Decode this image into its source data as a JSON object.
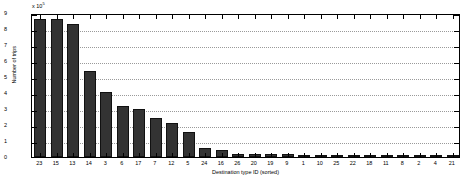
{
  "chart_data": {
    "type": "bar",
    "title": "",
    "xlabel": "Destination type ID (sorted)",
    "ylabel": "Number of trips",
    "y_multiplier": "x 10",
    "y_exponent": "5",
    "categories": [
      "23",
      "15",
      "13",
      "14",
      "3",
      "6",
      "17",
      "7",
      "12",
      "5",
      "24",
      "16",
      "26",
      "20",
      "19",
      "9",
      "1",
      "10",
      "25",
      "22",
      "18",
      "11",
      "8",
      "2",
      "4",
      "21"
    ],
    "values": [
      8.65,
      8.6,
      8.3,
      5.4,
      4.05,
      3.2,
      3.0,
      2.45,
      2.1,
      1.55,
      0.55,
      0.42,
      0.2,
      0.2,
      0.18,
      0.16,
      0.15,
      0.12,
      0.1,
      0.09,
      0.07,
      0.06,
      0.05,
      0.04,
      0.03,
      0.02
    ],
    "ylim": [
      0,
      9
    ],
    "yticks": [
      "0",
      "1",
      "2",
      "3",
      "4",
      "5",
      "6",
      "7",
      "8",
      "9"
    ],
    "grid": "horizontal-dotted",
    "legend": "none",
    "bar_color": "#333333",
    "frame_color": "#000000",
    "grid_color": "#9a9a9a",
    "background_color": "#ffffff"
  }
}
